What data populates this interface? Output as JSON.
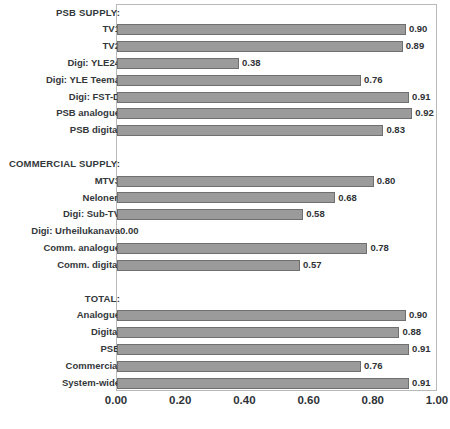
{
  "chart_data": {
    "type": "bar",
    "orientation": "horizontal",
    "title": "",
    "subtitle": "",
    "xlabel": "",
    "ylabel": "",
    "xlim": [
      0.0,
      1.0
    ],
    "xticks": [
      "0.00",
      "0.20",
      "0.40",
      "0.60",
      "0.80",
      "1.00"
    ],
    "xtick_values": [
      0.0,
      0.2,
      0.4,
      0.6,
      0.8,
      1.0
    ],
    "grid": false,
    "legend": false,
    "bar_color": "#9b9b9b",
    "bar_border_color": "#6f6f6f",
    "frame_color": "#b9b9b9",
    "label_format": "0.00",
    "rows": [
      {
        "label": "PSB SUPPLY:",
        "is_section": true,
        "value": null,
        "value_label": ""
      },
      {
        "label": "TV1",
        "is_section": false,
        "value": 0.9,
        "value_label": "0.90"
      },
      {
        "label": "TV2",
        "is_section": false,
        "value": 0.89,
        "value_label": "0.89"
      },
      {
        "label": "Digi: YLE24",
        "is_section": false,
        "value": 0.38,
        "value_label": "0.38"
      },
      {
        "label": "Digi: YLE Teema",
        "is_section": false,
        "value": 0.76,
        "value_label": "0.76"
      },
      {
        "label": "Digi: FST-D",
        "is_section": false,
        "value": 0.91,
        "value_label": "0.91"
      },
      {
        "label": "PSB analogue",
        "is_section": false,
        "value": 0.92,
        "value_label": "0.92"
      },
      {
        "label": "PSB digital",
        "is_section": false,
        "value": 0.83,
        "value_label": "0.83"
      },
      {
        "label": "",
        "is_section": false,
        "value": null,
        "value_label": ""
      },
      {
        "label": "COMMERCIAL SUPPLY:",
        "is_section": true,
        "value": null,
        "value_label": ""
      },
      {
        "label": "MTV3",
        "is_section": false,
        "value": 0.8,
        "value_label": "0.80"
      },
      {
        "label": "Nelonen",
        "is_section": false,
        "value": 0.68,
        "value_label": "0.68"
      },
      {
        "label": "Digi: Sub-TV",
        "is_section": false,
        "value": 0.58,
        "value_label": "0.58"
      },
      {
        "label": "Digi: Urheilukanava",
        "is_section": false,
        "value": 0.0,
        "value_label": "0.00"
      },
      {
        "label": "Comm. analogue",
        "is_section": false,
        "value": 0.78,
        "value_label": "0.78"
      },
      {
        "label": "Comm. digital",
        "is_section": false,
        "value": 0.57,
        "value_label": "0.57"
      },
      {
        "label": "",
        "is_section": false,
        "value": null,
        "value_label": ""
      },
      {
        "label": "TOTAL:",
        "is_section": true,
        "value": null,
        "value_label": ""
      },
      {
        "label": "Analogue",
        "is_section": false,
        "value": 0.9,
        "value_label": "0.90"
      },
      {
        "label": "Digital",
        "is_section": false,
        "value": 0.88,
        "value_label": "0.88"
      },
      {
        "label": "PSB",
        "is_section": false,
        "value": 0.91,
        "value_label": "0.91"
      },
      {
        "label": "Commercial",
        "is_section": false,
        "value": 0.76,
        "value_label": "0.76"
      },
      {
        "label": "System-wide",
        "is_section": false,
        "value": 0.91,
        "value_label": "0.91"
      }
    ],
    "categories": [
      "PSB SUPPLY:",
      "TV1",
      "TV2",
      "Digi: YLE24",
      "Digi: YLE Teema",
      "Digi: FST-D",
      "PSB analogue",
      "PSB digital",
      "",
      "COMMERCIAL SUPPLY:",
      "MTV3",
      "Nelonen",
      "Digi: Sub-TV",
      "Digi: Urheilukanava",
      "Comm. analogue",
      "Comm. digital",
      "",
      "TOTAL:",
      "Analogue",
      "Digital",
      "PSB",
      "Commercial",
      "System-wide"
    ],
    "values": [
      null,
      0.9,
      0.89,
      0.38,
      0.76,
      0.91,
      0.92,
      0.83,
      null,
      null,
      0.8,
      0.68,
      0.58,
      0.0,
      0.78,
      0.57,
      null,
      null,
      0.9,
      0.88,
      0.91,
      0.76,
      0.91
    ]
  }
}
